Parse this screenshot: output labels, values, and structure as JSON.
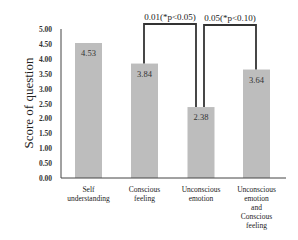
{
  "chart_data": {
    "type": "bar",
    "title": "",
    "xlabel": "",
    "ylabel": "Score of question",
    "ylim": [
      0,
      5
    ],
    "yticks": [
      "0.00",
      "0.50",
      "1.00",
      "1.50",
      "2.00",
      "2.50",
      "3.00",
      "3.50",
      "4.00",
      "4.50",
      "5.00"
    ],
    "grid": false,
    "legend": null,
    "categories": [
      [
        "Self",
        "understanding"
      ],
      [
        "Conscious",
        "feeling"
      ],
      [
        "Unconscious",
        "emotion"
      ],
      [
        "Unconscious",
        "emotion",
        "and",
        "Conscious",
        "feeling"
      ]
    ],
    "values": [
      4.53,
      3.84,
      2.38,
      3.64
    ],
    "value_labels": [
      "4.53",
      "3.84",
      "2.38",
      "3.64"
    ],
    "bar_color": "#bdbdbd",
    "annotations": [
      {
        "text": "0.01(*p<0.05)",
        "from": 1,
        "to": 2
      },
      {
        "text": "0.05(*p<0.10)",
        "from": 2,
        "to": 3
      }
    ]
  }
}
